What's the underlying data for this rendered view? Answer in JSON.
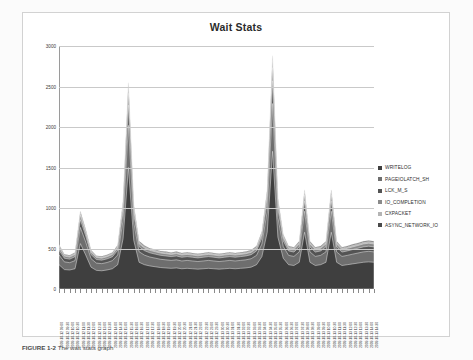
{
  "figure": {
    "caption_label": "FIGURE 1-2",
    "caption_text": "The wait stats graph"
  },
  "chart_data": {
    "type": "area",
    "stacked": true,
    "title": "Wait Stats",
    "xlabel": "",
    "ylabel": "",
    "ylim": [
      0,
      3000
    ],
    "yticks": [
      0,
      500,
      1000,
      1500,
      2000,
      2500,
      3000
    ],
    "grid": true,
    "legend_position": "right",
    "colors": {
      "WRITELOG": "#3f3f3f",
      "PAGEIOLATCH_SH": "#6e6e6e",
      "LCK_M_S": "#545454",
      "IO_COMPLETION": "#8a8a8a",
      "CXPACKET": "#b4b4b4",
      "ASYNC_NETWORK_IO": "#4a4a4a"
    },
    "categories": [
      "2009-10-12 09:00",
      "2009-10-12 09:30",
      "2009-10-12 10:00",
      "2009-10-12 10:30",
      "2009-10-12 11:00",
      "2009-10-12 11:30",
      "2009-10-12 12:00",
      "2009-10-12 12:30",
      "2009-10-12 13:00",
      "2009-10-12 13:30",
      "2009-10-12 14:00",
      "2009-10-12 14:30",
      "2009-10-12 15:00",
      "2009-10-12 15:30",
      "2009-10-12 16:00",
      "2009-10-12 16:30",
      "2009-10-12 17:00",
      "2009-10-12 17:30",
      "2009-10-12 18:00",
      "2009-10-12 18:30",
      "2009-10-12 19:00",
      "2009-10-12 19:30",
      "2009-10-12 20:00",
      "2009-10-12 20:30",
      "2009-10-12 21:00",
      "2009-10-12 21:30",
      "2009-10-12 22:00",
      "2009-10-12 22:30",
      "2009-10-12 23:00",
      "2009-10-12 23:30",
      "2009-10-13 00:00",
      "2009-10-13 00:30",
      "2009-10-13 01:00",
      "2009-10-13 01:30",
      "2009-10-13 02:00",
      "2009-10-13 02:30",
      "2009-10-13 03:00",
      "2009-10-13 03:30",
      "2009-10-13 04:00",
      "2009-10-13 04:30",
      "2009-10-13 05:00",
      "2009-10-13 05:30",
      "2009-10-13 06:00",
      "2009-10-13 06:30",
      "2009-10-13 07:00",
      "2009-10-13 07:30",
      "2009-10-13 08:00",
      "2009-10-13 08:30",
      "2009-10-13 09:00",
      "2009-10-13 09:30",
      "2009-10-13 10:00",
      "2009-10-13 10:30",
      "2009-10-13 11:00",
      "2009-10-13 11:30",
      "2009-10-13 12:00",
      "2009-10-13 12:30",
      "2009-10-13 13:00",
      "2009-10-13 13:30",
      "2009-10-13 14:00",
      "2009-10-13 14:30"
    ],
    "series": [
      {
        "name": "WRITELOG",
        "values": [
          300,
          240,
          235,
          250,
          560,
          420,
          270,
          230,
          225,
          235,
          250,
          300,
          620,
          1500,
          600,
          330,
          300,
          285,
          275,
          265,
          260,
          255,
          260,
          250,
          255,
          250,
          245,
          250,
          255,
          250,
          245,
          250,
          255,
          250,
          255,
          260,
          270,
          300,
          400,
          700,
          1700,
          640,
          380,
          300,
          290,
          330,
          700,
          330,
          290,
          300,
          330,
          700,
          330,
          290,
          300,
          310,
          320,
          330,
          335,
          330
        ]
      },
      {
        "name": "PAGEIOLATCH_SH",
        "values": [
          120,
          95,
          90,
          100,
          200,
          160,
          105,
          90,
          88,
          92,
          100,
          120,
          230,
          520,
          220,
          130,
          118,
          110,
          106,
          102,
          100,
          98,
          100,
          96,
          98,
          96,
          94,
          96,
          98,
          96,
          94,
          96,
          98,
          96,
          98,
          100,
          104,
          115,
          155,
          260,
          590,
          240,
          145,
          115,
          112,
          128,
          260,
          128,
          112,
          115,
          128,
          260,
          128,
          112,
          115,
          120,
          124,
          128,
          130,
          128
        ]
      },
      {
        "name": "LCK_M_S",
        "values": [
          60,
          45,
          44,
          48,
          95,
          75,
          50,
          44,
          43,
          45,
          48,
          58,
          110,
          250,
          105,
          62,
          56,
          52,
          50,
          49,
          48,
          47,
          48,
          46,
          47,
          46,
          45,
          46,
          47,
          46,
          45,
          46,
          47,
          46,
          47,
          48,
          50,
          55,
          74,
          125,
          280,
          115,
          70,
          55,
          54,
          62,
          125,
          62,
          54,
          55,
          62,
          125,
          62,
          54,
          55,
          57,
          59,
          62,
          63,
          62
        ]
      },
      {
        "name": "IO_COMPLETION",
        "values": [
          35,
          26,
          25,
          28,
          55,
          44,
          29,
          25,
          25,
          26,
          28,
          34,
          64,
          145,
          61,
          36,
          33,
          30,
          29,
          28,
          28,
          27,
          28,
          27,
          27,
          27,
          26,
          27,
          27,
          27,
          26,
          27,
          27,
          27,
          27,
          28,
          29,
          32,
          43,
          73,
          162,
          67,
          41,
          32,
          31,
          36,
          73,
          36,
          31,
          32,
          36,
          73,
          36,
          31,
          32,
          33,
          34,
          36,
          37,
          36
        ]
      },
      {
        "name": "CXPACKET",
        "values": [
          20,
          15,
          14,
          16,
          31,
          25,
          17,
          14,
          14,
          15,
          16,
          19,
          36,
          82,
          35,
          21,
          19,
          17,
          17,
          16,
          16,
          15,
          16,
          15,
          16,
          15,
          15,
          15,
          16,
          15,
          15,
          15,
          16,
          15,
          16,
          16,
          17,
          18,
          24,
          41,
          92,
          38,
          23,
          18,
          18,
          21,
          41,
          21,
          18,
          18,
          21,
          41,
          21,
          18,
          18,
          19,
          20,
          21,
          21,
          21
        ]
      },
      {
        "name": "ASYNC_NETWORK_IO",
        "values": [
          12,
          9,
          9,
          10,
          19,
          15,
          10,
          9,
          9,
          9,
          10,
          11,
          22,
          50,
          21,
          13,
          11,
          10,
          10,
          10,
          10,
          9,
          10,
          9,
          10,
          9,
          9,
          9,
          10,
          9,
          9,
          9,
          10,
          9,
          10,
          10,
          10,
          11,
          14,
          25,
          56,
          23,
          14,
          11,
          11,
          13,
          25,
          13,
          11,
          11,
          13,
          25,
          13,
          11,
          11,
          12,
          12,
          13,
          13,
          13
        ]
      }
    ]
  },
  "legend": {
    "items": [
      {
        "label": "WRITELOG",
        "color": "#3f3f3f"
      },
      {
        "label": "PAGEIOLATCH_SH",
        "color": "#6e6e6e"
      },
      {
        "label": "LCK_M_S",
        "color": "#545454"
      },
      {
        "label": "IO_COMPLETION",
        "color": "#8a8a8a"
      },
      {
        "label": "CXPACKET",
        "color": "#b4b4b4"
      },
      {
        "label": "ASYNC_NETWORK_IO",
        "color": "#4a4a4a"
      }
    ]
  }
}
